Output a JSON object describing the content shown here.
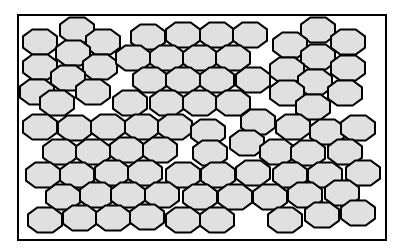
{
  "figure": {
    "title": "",
    "frame": {
      "x": 18,
      "y": 15,
      "width": 366,
      "height": 223
    },
    "colors": {
      "grain_fill": "#e0e0e0",
      "grain_stroke": "#000000",
      "frame_stroke": "#000000",
      "background": "#ffffff"
    },
    "grain_size": {
      "width": 34,
      "height": 25
    },
    "grains": [
      [
        40,
        42
      ],
      [
        77,
        30
      ],
      [
        103,
        42
      ],
      [
        73,
        53
      ],
      [
        40,
        67
      ],
      [
        100,
        67
      ],
      [
        68,
        78
      ],
      [
        37,
        92
      ],
      [
        93,
        92
      ],
      [
        148,
        37
      ],
      [
        183,
        35
      ],
      [
        217,
        35
      ],
      [
        250,
        35
      ],
      [
        133,
        58
      ],
      [
        167,
        58
      ],
      [
        200,
        58
      ],
      [
        233,
        58
      ],
      [
        150,
        80
      ],
      [
        183,
        80
      ],
      [
        217,
        80
      ],
      [
        253,
        80
      ],
      [
        318,
        30
      ],
      [
        348,
        42
      ],
      [
        290,
        45
      ],
      [
        318,
        57
      ],
      [
        348,
        68
      ],
      [
        287,
        70
      ],
      [
        315,
        82
      ],
      [
        345,
        93
      ],
      [
        287,
        93
      ],
      [
        57,
        103
      ],
      [
        130,
        103
      ],
      [
        167,
        103
      ],
      [
        200,
        103
      ],
      [
        233,
        103
      ],
      [
        313,
        107
      ],
      [
        40,
        127
      ],
      [
        75,
        128
      ],
      [
        108,
        127
      ],
      [
        142,
        127
      ],
      [
        175,
        127
      ],
      [
        208,
        132
      ],
      [
        258,
        122
      ],
      [
        293,
        127
      ],
      [
        327,
        132
      ],
      [
        358,
        128
      ],
      [
        60,
        152
      ],
      [
        93,
        152
      ],
      [
        127,
        150
      ],
      [
        160,
        150
      ],
      [
        210,
        153
      ],
      [
        247,
        143
      ],
      [
        277,
        152
      ],
      [
        308,
        153
      ],
      [
        345,
        152
      ],
      [
        43,
        175
      ],
      [
        77,
        175
      ],
      [
        112,
        173
      ],
      [
        145,
        173
      ],
      [
        183,
        175
      ],
      [
        218,
        175
      ],
      [
        253,
        173
      ],
      [
        290,
        175
      ],
      [
        325,
        175
      ],
      [
        363,
        173
      ],
      [
        63,
        197
      ],
      [
        97,
        195
      ],
      [
        128,
        195
      ],
      [
        162,
        195
      ],
      [
        200,
        197
      ],
      [
        235,
        197
      ],
      [
        270,
        197
      ],
      [
        305,
        195
      ],
      [
        342,
        193
      ],
      [
        45,
        220
      ],
      [
        80,
        218
      ],
      [
        113,
        218
      ],
      [
        147,
        217
      ],
      [
        183,
        220
      ],
      [
        217,
        220
      ],
      [
        285,
        220
      ],
      [
        322,
        215
      ],
      [
        358,
        213
      ]
    ]
  }
}
